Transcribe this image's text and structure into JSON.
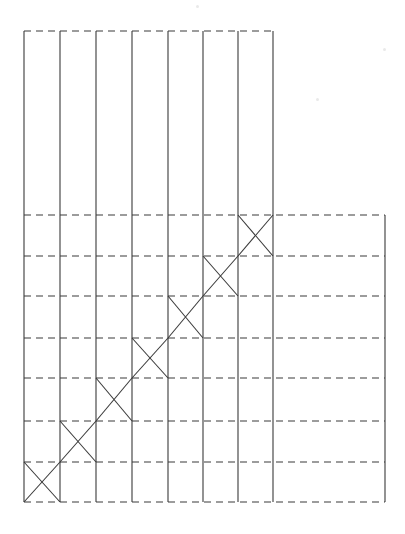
{
  "figure": {
    "title": "",
    "type": "lattice-diagram",
    "background_color": "#ffffff",
    "line_color": "#3a3a3a",
    "solid_stroke_width": 1.1,
    "dashed_stroke_width": 1.1,
    "dash_pattern": "7,5"
  },
  "geometry": {
    "canvas": {
      "width": 405,
      "height": 534
    },
    "narrow_region": {
      "left": 24,
      "right": 273,
      "top": 31,
      "bottom": 502
    },
    "wide_region": {
      "left": 24,
      "right": 385,
      "top": 215,
      "bottom": 502
    },
    "vertical_lines_x": [
      24,
      60,
      96,
      132,
      168,
      203,
      238,
      273
    ],
    "right_edge_x": 385,
    "horizontal_lines_y": [
      31,
      215,
      256,
      296,
      338,
      378,
      421,
      462,
      502
    ],
    "narrow_only_top_line_y": 31,
    "cell_columns": 7,
    "cell_rows": 7
  },
  "crossed_cells": [
    {
      "index": 0,
      "col": 6,
      "row": 0,
      "x0": 238,
      "x1": 273,
      "y0": 215,
      "y1": 256
    },
    {
      "index": 1,
      "col": 5,
      "row": 1,
      "x0": 203,
      "x1": 238,
      "y0": 256,
      "y1": 296
    },
    {
      "index": 2,
      "col": 4,
      "row": 2,
      "x0": 168,
      "x1": 203,
      "y0": 296,
      "y1": 338
    },
    {
      "index": 3,
      "col": 3,
      "row": 3,
      "x0": 132,
      "x1": 168,
      "y0": 338,
      "y1": 378
    },
    {
      "index": 4,
      "col": 2,
      "row": 4,
      "x0": 96,
      "x1": 132,
      "y0": 378,
      "y1": 421
    },
    {
      "index": 5,
      "col": 1,
      "row": 5,
      "x0": 60,
      "x1": 96,
      "y0": 421,
      "y1": 462
    },
    {
      "index": 6,
      "col": 0,
      "row": 6,
      "x0": 24,
      "x1": 60,
      "y0": 462,
      "y1": 502
    }
  ],
  "main_diagonal": {
    "description": "continuous ascending diagonal from bottom-left corner to top-right crossed cell",
    "start": {
      "x": 24,
      "y": 502
    },
    "end": {
      "x": 273,
      "y": 215
    }
  },
  "anti_diagonals": [
    {
      "from": {
        "x": 238,
        "y": 215
      },
      "to": {
        "x": 273,
        "y": 256
      }
    },
    {
      "from": {
        "x": 203,
        "y": 256
      },
      "to": {
        "x": 238,
        "y": 296
      }
    },
    {
      "from": {
        "x": 168,
        "y": 296
      },
      "to": {
        "x": 203,
        "y": 338
      }
    },
    {
      "from": {
        "x": 132,
        "y": 338
      },
      "to": {
        "x": 168,
        "y": 378
      }
    },
    {
      "from": {
        "x": 96,
        "y": 378
      },
      "to": {
        "x": 132,
        "y": 421
      }
    },
    {
      "from": {
        "x": 60,
        "y": 421
      },
      "to": {
        "x": 96,
        "y": 462
      }
    },
    {
      "from": {
        "x": 24,
        "y": 462
      },
      "to": {
        "x": 60,
        "y": 502
      }
    }
  ],
  "specks": [
    {
      "x": 196,
      "y": 5
    },
    {
      "x": 383,
      "y": 48
    },
    {
      "x": 316,
      "y": 98
    }
  ]
}
